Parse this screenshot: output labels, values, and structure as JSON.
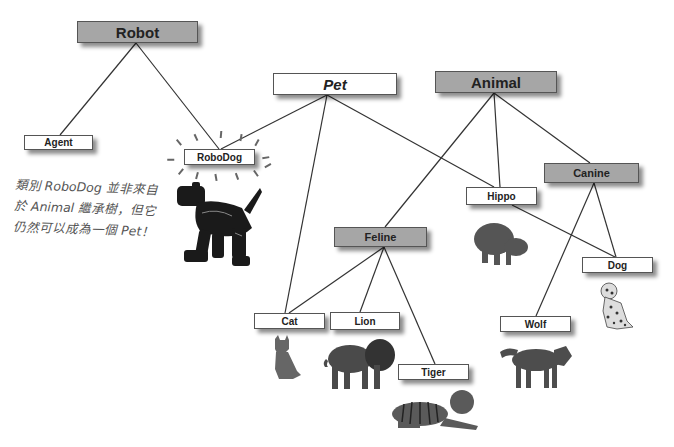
{
  "diagram": {
    "type": "inheritance-tree",
    "nodes": {
      "robot": {
        "label": "Robot",
        "style": "gray-large"
      },
      "agent": {
        "label": "Agent",
        "style": "white"
      },
      "robodog": {
        "label": "RoboDog",
        "style": "white"
      },
      "pet": {
        "label": "Pet",
        "style": "white-large-italic"
      },
      "animal": {
        "label": "Animal",
        "style": "gray-large"
      },
      "hippo": {
        "label": "Hippo",
        "style": "white"
      },
      "canine": {
        "label": "Canine",
        "style": "gray"
      },
      "feline": {
        "label": "Feline",
        "style": "gray"
      },
      "dog": {
        "label": "Dog",
        "style": "white"
      },
      "cat": {
        "label": "Cat",
        "style": "white"
      },
      "lion": {
        "label": "Lion",
        "style": "white"
      },
      "tiger": {
        "label": "Tiger",
        "style": "white"
      },
      "wolf": {
        "label": "Wolf",
        "style": "white"
      }
    },
    "edges": [
      [
        "Robot",
        "Agent"
      ],
      [
        "Robot",
        "RoboDog"
      ],
      [
        "Pet",
        "RoboDog"
      ],
      [
        "Pet",
        "Cat"
      ],
      [
        "Pet",
        "Dog"
      ],
      [
        "Animal",
        "Feline"
      ],
      [
        "Animal",
        "Hippo"
      ],
      [
        "Animal",
        "Canine"
      ],
      [
        "Feline",
        "Cat"
      ],
      [
        "Feline",
        "Lion"
      ],
      [
        "Feline",
        "Tiger"
      ],
      [
        "Canine",
        "Dog"
      ],
      [
        "Canine",
        "Wolf"
      ]
    ],
    "annotation": {
      "line1": "類別 RoboDog 並非來自",
      "line2": "於 Animal 繼承樹，但它",
      "line3": "仍然可以成為一個 Pet！"
    },
    "images": [
      "robot-dog",
      "hippo",
      "dalmatian-dog",
      "cat",
      "lion",
      "tiger",
      "wolf"
    ],
    "colors": {
      "gray_box": "#a6a6a6",
      "white_box": "#ffffff",
      "line": "#333333"
    }
  }
}
